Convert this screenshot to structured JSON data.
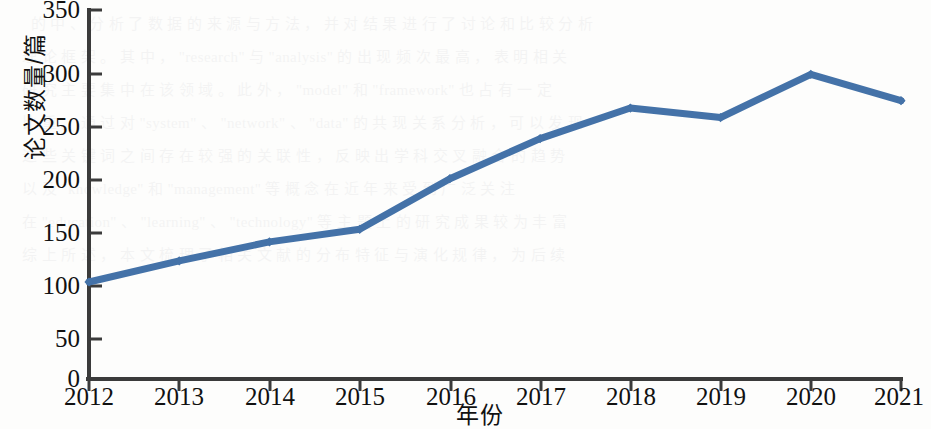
{
  "chart_data": {
    "type": "line",
    "title": "",
    "xlabel": "年份",
    "ylabel": "论文数量/篇",
    "categories": [
      "2012",
      "2013",
      "2014",
      "2015",
      "2016",
      "2017",
      "2018",
      "2019",
      "2020",
      "2021"
    ],
    "values": [
      92,
      112,
      130,
      142,
      190,
      228,
      257,
      248,
      289,
      264
    ],
    "series": [
      {
        "name": "论文数量",
        "values": [
          92,
          112,
          130,
          142,
          190,
          228,
          257,
          248,
          289,
          264
        ]
      }
    ],
    "ylim": [
      0,
      350
    ],
    "yticks": [
      0,
      50,
      100,
      150,
      200,
      250,
      300,
      350
    ],
    "ytick_labels": [
      "0",
      "50",
      "100",
      "150",
      "200",
      "250",
      "300",
      "350"
    ],
    "xtick_labels": [
      "2012",
      "2013",
      "2014",
      "2015",
      "2016",
      "2017",
      "2018",
      "2019",
      "2020",
      "2021"
    ],
    "grid": false,
    "legend": null,
    "legend_position": "none",
    "line_color": "#4472a8",
    "marker": "diamond",
    "annotations": []
  },
  "figure": {
    "background_color": "#fdfdfc",
    "axis_color": "#3b3b3b",
    "text_color": "#111111"
  },
  "bleed_through": {
    "text": "    的 中 、 分 析 了 数 据 的 来 源 与 方 法 ， 并 对 结 果 进 行 了 讨 论 和 比 较 分 析\n  理 论 框 架 。 其 中 ， \"research\" 与 \"analysis\" 的 出 现 频 次 最 高 ， 表 明 相 关\n  研 究 主 要 集 中 在 该 领 域 。 此 外 ， \"model\" 和 \"framework\" 也 占 有 一 定\n  比 重 。 通 过 对 \"system\" 、 \"network\" 、 \"data\" 的 共 现 关 系 分 析 ， 可 以 发 现\n  这 些 关 键 词 之 间 存 在 较 强 的 关 联 性 ， 反 映 出 学 科 交 叉 融 合 的 趋 势\n  以 及 \"knowledge\" 和 \"management\" 等 概 念 在 近 年 来 受 到 广 泛 关 注\n  在 \"education\" 、 \"learning\" 、 \"technology\" 等 主 题 上 的 研 究 成 果 较 为 丰 富\n  综 上 所 述 ， 本 文 梳 理 了 相 关 文 献 的 分 布 特 征 与 演 化 规 律 ， 为 后 续"
  }
}
